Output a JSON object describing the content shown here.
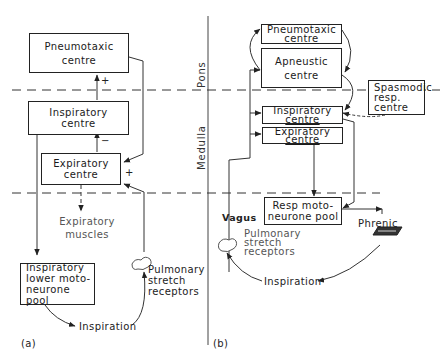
{
  "panel_a": {
    "label": "(a)",
    "boxes": {
      "pneumotaxic": [
        "Pneumotaxic",
        "centre"
      ],
      "inspiratory": [
        "Inspiratory",
        "centre"
      ],
      "expiratory": [
        "Expiratory",
        "centre"
      ],
      "lower_motoneurone": [
        "Inspiratory",
        "lower moto-",
        "neurone pool"
      ]
    },
    "labels": {
      "expiratory_muscles": [
        "Expiratory",
        "muscles"
      ],
      "pulmonary": [
        "Pulmonary",
        "stretch",
        "receptors"
      ],
      "inspiration": "Inspiration"
    },
    "signs": {
      "insp_to_pneumo": "+",
      "exp_to_insp": "−",
      "pneumo_to_exp": "+"
    }
  },
  "panel_b": {
    "label": "(b)",
    "region_labels": {
      "pons": "Pons",
      "medulla": "Medulla"
    },
    "boxes": {
      "pneumotaxic": [
        "Pneumotaxic",
        "centre"
      ],
      "apneustic": [
        "Apneustic",
        "centre"
      ],
      "spasmodic": [
        "Spasmodic",
        "resp.",
        "centre"
      ],
      "inspiratory": [
        "Inspiratory",
        "centre"
      ],
      "expiratory": [
        "Expiratory",
        "centre"
      ],
      "resp_motoneurone": [
        "Resp moto-",
        "neurone pool"
      ]
    },
    "labels": {
      "vagus": "Vagus",
      "phrenic": "Phrenic",
      "pulmonary": [
        "Pulmonary",
        "stretch",
        "receptors"
      ],
      "inspiration": "Inspiration"
    }
  }
}
